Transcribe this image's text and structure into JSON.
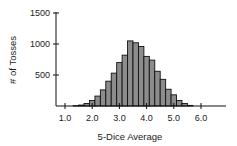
{
  "chart_data": {
    "type": "bar",
    "title": "",
    "xlabel": "5-Dice Average",
    "ylabel": "# of Tosses",
    "xlim": [
      0.7,
      6.9
    ],
    "ylim": [
      0,
      1500
    ],
    "xticks": [
      1.0,
      2.0,
      3.0,
      4.0,
      5.0,
      6.0
    ],
    "xtick_labels": [
      "1.0",
      "2.0",
      "3.0",
      "4.0",
      "5.0",
      "6.0"
    ],
    "yticks": [
      500,
      1000,
      1500
    ],
    "ytick_labels": [
      "500",
      "1000",
      "1500"
    ],
    "bin_width": 0.2,
    "grid": false,
    "legend": null,
    "categories": [
      1.4,
      1.6,
      1.8,
      2.0,
      2.2,
      2.4,
      2.6,
      2.8,
      3.0,
      3.2,
      3.4,
      3.6,
      3.8,
      4.0,
      4.2,
      4.4,
      4.6,
      4.8,
      5.0,
      5.2,
      5.4,
      5.6
    ],
    "values": [
      5,
      15,
      40,
      90,
      160,
      260,
      400,
      530,
      700,
      820,
      1050,
      1020,
      960,
      800,
      740,
      560,
      430,
      270,
      180,
      90,
      40,
      10
    ],
    "colors": {
      "bar_fill": "#8c8c8c",
      "bar_edge": "#111111",
      "axis": "#111111"
    }
  }
}
